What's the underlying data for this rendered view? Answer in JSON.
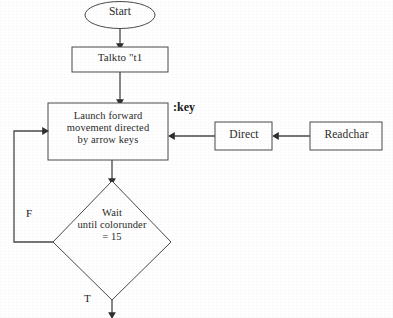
{
  "diagram": {
    "background_color": "#ffffff",
    "line_color": "#4a4a4a",
    "text_color": "#2b2b2b"
  },
  "nodes": {
    "start": {
      "label": "Start",
      "shape": "oval"
    },
    "talkto": {
      "label": "Talkto \"t1",
      "shape": "rectangle"
    },
    "launch": {
      "label": "Launch forward\nmovement directed\nby arrow keys",
      "shape": "rectangle"
    },
    "wait": {
      "label": "Wait\nuntil colorunder\n= 15",
      "shape": "diamond"
    },
    "direct": {
      "label": "Direct",
      "shape": "rectangle"
    },
    "readchar": {
      "label": "Readchar",
      "shape": "rectangle"
    }
  },
  "edge_labels": {
    "key": ":key",
    "false_branch": "F",
    "true_branch": "T"
  }
}
